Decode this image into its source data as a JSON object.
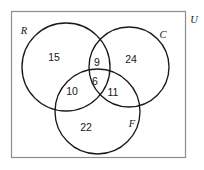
{
  "diagram": {
    "type": "venn-3-set",
    "universe_label": "U",
    "sets": [
      {
        "id": "R",
        "label": "R",
        "name": "left-set"
      },
      {
        "id": "C",
        "label": "C",
        "name": "right-set"
      },
      {
        "id": "F",
        "label": "F",
        "name": "bottom-set"
      }
    ],
    "regions": [
      {
        "id": "R_only",
        "label": "15",
        "description": "R only"
      },
      {
        "id": "C_only",
        "label": "24",
        "description": "C only"
      },
      {
        "id": "F_only",
        "label": "22",
        "description": "F only"
      },
      {
        "id": "R_and_C",
        "label": "9",
        "description": "R and C only"
      },
      {
        "id": "R_and_F",
        "label": "10",
        "description": "R and F only"
      },
      {
        "id": "C_and_F",
        "label": "11",
        "description": "C and F only"
      },
      {
        "id": "R_C_F",
        "label": "6",
        "description": "R and C and F"
      }
    ],
    "colors": {
      "circle_stroke": "#1a1a1a",
      "rect_stroke": "#8d8d8d",
      "text": "#161616",
      "background": "#ffffff"
    }
  }
}
